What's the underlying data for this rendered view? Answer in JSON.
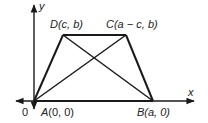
{
  "diagram": {
    "type": "trapezoid-coordinate-figure",
    "axes": {
      "x_label": "x",
      "y_label": "y",
      "origin_label": "0"
    },
    "points": {
      "A": {
        "label_name": "A",
        "coords": "(0, 0)"
      },
      "B": {
        "label_name": "B",
        "coords": "(a, 0)"
      },
      "C": {
        "label_name": "C",
        "coords": "(a − c, b)"
      },
      "D": {
        "label_name": "D",
        "coords": "(c, b)"
      }
    },
    "segments": [
      "AB",
      "BC",
      "CD",
      "DA",
      "AC",
      "BD"
    ],
    "colors": {
      "stroke": "#1a1a1a",
      "text": "#222222",
      "background": "#ffffff"
    }
  }
}
